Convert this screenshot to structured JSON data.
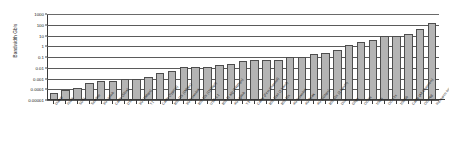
{
  "chart_data": {
    "type": "bar",
    "title": "",
    "xlabel": "",
    "ylabel": "Bandwidth Gb/s",
    "yscale": "log",
    "ylim": [
      1e-05,
      1000
    ],
    "grid": true,
    "legend": false,
    "ytick_labels": [
      "1000",
      "100",
      "10",
      "1",
      "0.1",
      "0.01",
      "0.001",
      "0.0001",
      "0.00001"
    ],
    "ytick_values": [
      1000,
      100,
      10,
      1,
      0.1,
      0.01,
      0.001,
      0.0001,
      1e-05
    ],
    "categories": [
      "Dialup",
      "ISDN",
      "SDSL",
      "Satellite",
      "3G Uplink",
      "Cable (Slow)",
      "DS1",
      "3G (1Mbps)",
      "T1",
      "Cable (Typical)",
      "802.11b (1Mbps)",
      "3G Downlink",
      "802.11b (11Mbps)",
      "USB 1.1",
      "802.11 a/g (54Mbps)",
      "4G Uplink",
      "T3",
      "Cable (First Channel)",
      "802.11ac (1 band)",
      "802.11n",
      "4G Downlink",
      "4G Peak",
      "4G (1Gbps)",
      "802.11n (3 bands)",
      "Disk",
      "Gbps",
      "OC-3x",
      "10Gb",
      "OC-12x",
      "100Gb",
      "Cable (All Channels)",
      "OC-768",
      "Research Internet + Fiber"
    ],
    "values": [
      5e-05,
      8.8e-05,
      0.00012,
      0.0004,
      0.0006,
      0.00055,
      0.001,
      0.001,
      0.0015,
      0.003,
      0.005,
      0.011,
      0.011,
      0.012,
      0.02,
      0.024,
      0.045,
      0.054,
      0.054,
      0.054,
      0.1,
      0.1,
      0.2,
      0.25,
      0.45,
      1.2,
      2.5,
      3.5,
      10,
      10,
      13,
      40,
      150
    ],
    "units": "Gb/s"
  }
}
